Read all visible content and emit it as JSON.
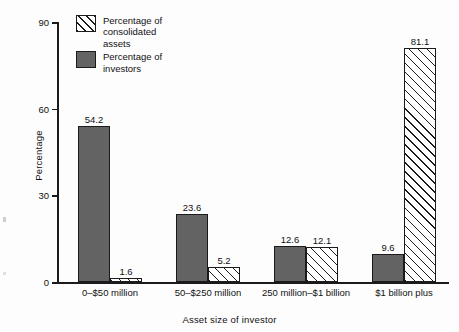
{
  "chart_data": {
    "type": "bar",
    "title": "",
    "subtitle": "",
    "xlabel": "Asset size of investor",
    "ylabel": "Percentage",
    "ylim": [
      0,
      90
    ],
    "yticks": [
      0,
      30,
      60,
      90
    ],
    "ytick_labels": [
      "0",
      "30",
      "60",
      "90"
    ],
    "grid": false,
    "legend_position": "top-left",
    "categories": [
      "0–$50 million",
      "50–$250 million",
      "250 million–$1 billion",
      "$1 billion plus"
    ],
    "series": [
      {
        "name": "Percentage of investors",
        "style": "solid-dark-gray",
        "color": "#636363",
        "values": [
          54.2,
          23.6,
          12.6,
          9.6
        ],
        "value_labels": [
          "54.2",
          "23.6",
          "12.6",
          "9.6"
        ]
      },
      {
        "name": "Percentage of consolidated assets",
        "style": "diagonal-hatch",
        "color": "#ffffff",
        "values": [
          1.6,
          5.2,
          12.1,
          81.1
        ],
        "value_labels": [
          "1.6",
          "5.2",
          "12.1",
          "81.1"
        ]
      }
    ]
  },
  "legend": {
    "items": [
      {
        "label": "Percentage of\nconsolidated\nassets",
        "swatch": "assets"
      },
      {
        "label": "Percentage of\ninvestors",
        "swatch": "investors"
      }
    ]
  },
  "colors": {
    "investors_fill": "#636363",
    "assets_fill": "#ffffff",
    "outline": "#1b1b1b",
    "background": "#fdfdfd"
  }
}
